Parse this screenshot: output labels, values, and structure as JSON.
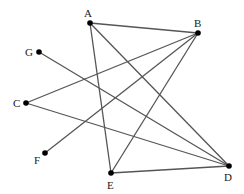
{
  "diagram": {
    "type": "graph",
    "edge_color": "#555555",
    "node_color": "#000000",
    "nodes": [
      {
        "id": "A",
        "label": "A",
        "x": 90,
        "y": 23,
        "lx": 84,
        "ly": 8
      },
      {
        "id": "B",
        "label": "B",
        "x": 198,
        "y": 33,
        "lx": 194,
        "ly": 18
      },
      {
        "id": "G",
        "label": "G",
        "x": 39,
        "y": 52,
        "lx": 25,
        "ly": 47
      },
      {
        "id": "C",
        "label": "C",
        "x": 26,
        "y": 103,
        "lx": 13,
        "ly": 98
      },
      {
        "id": "F",
        "label": "F",
        "x": 45,
        "y": 153,
        "lx": 34,
        "ly": 155
      },
      {
        "id": "E",
        "label": "E",
        "x": 111,
        "y": 173,
        "lx": 107,
        "ly": 180
      },
      {
        "id": "D",
        "label": "D",
        "x": 229,
        "y": 166,
        "lx": 224,
        "ly": 172
      }
    ],
    "edges": [
      [
        "A",
        "B"
      ],
      [
        "A",
        "E"
      ],
      [
        "A",
        "D"
      ],
      [
        "B",
        "C"
      ],
      [
        "B",
        "F"
      ],
      [
        "B",
        "E"
      ],
      [
        "G",
        "D"
      ],
      [
        "C",
        "D"
      ],
      [
        "E",
        "D"
      ]
    ]
  }
}
